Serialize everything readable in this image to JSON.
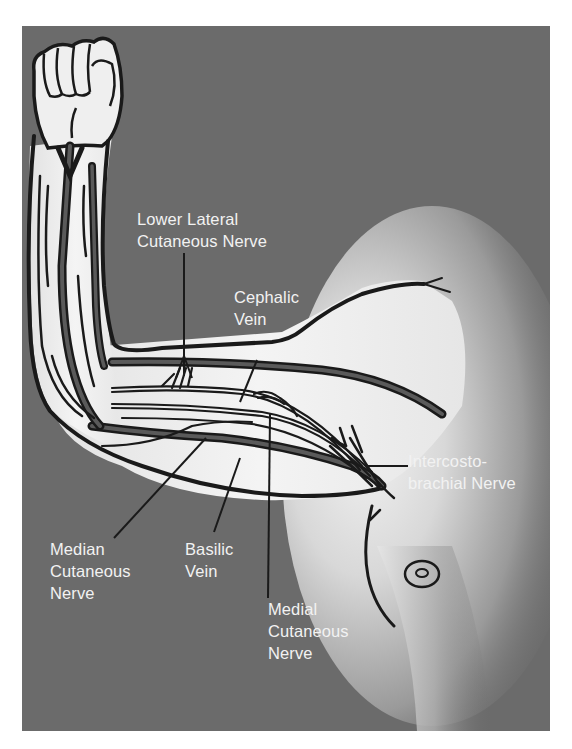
{
  "figure": {
    "background_color": "#6b6b6b",
    "skin_color": "#ededed",
    "outline_color": "#1a1a1a",
    "label_color": "#f2f2f2"
  },
  "labels": {
    "lower_lateral_cutaneous_nerve": {
      "line1": "Lower Lateral",
      "line2": "Cutaneous Nerve"
    },
    "cephalic_vein": {
      "line1": "Cephalic",
      "line2": "Vein"
    },
    "intercostobrachial_nerve": {
      "line1": "Intercosto-",
      "line2": "brachial Nerve"
    },
    "median_cutaneous_nerve": {
      "line1": "Median",
      "line2": "Cutaneous",
      "line3": "Nerve"
    },
    "basilic_vein": {
      "line1": "Basilic",
      "line2": "Vein"
    },
    "medial_cutaneous_nerve": {
      "line1": "Medial",
      "line2": "Cutaneous",
      "line3": "Nerve"
    }
  }
}
